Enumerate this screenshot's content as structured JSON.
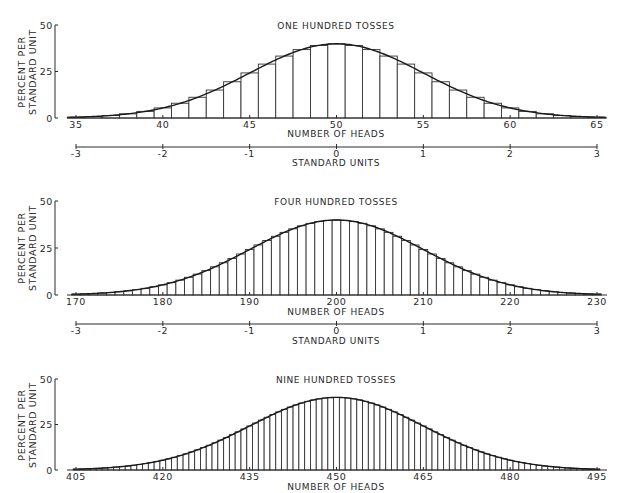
{
  "chart_data": [
    {
      "type": "bar",
      "title": "ONE HUNDRED TOSSES",
      "tosses": 100,
      "xlabel": "NUMBER OF HEADS",
      "ylabel": [
        "PERCENT PER",
        "STANDARD UNIT"
      ],
      "ylim": [
        0,
        50
      ],
      "yticks": [
        0,
        25,
        50
      ],
      "x_range": [
        35,
        65
      ],
      "xticks": [
        35,
        40,
        45,
        50,
        55,
        60,
        65
      ],
      "standard_units_axis": {
        "label": "STANDARD UNITS",
        "ticks": [
          -3,
          -2,
          -1,
          0,
          1,
          2,
          3
        ]
      },
      "overlay": "normal curve",
      "note": "histogram of binomial probability (p=0.5) for number of heads, scaled in percent per standard unit; peak about 39.8"
    },
    {
      "type": "bar",
      "title": "FOUR HUNDRED TOSSES",
      "tosses": 400,
      "xlabel": "NUMBER OF HEADS",
      "ylabel": [
        "PERCENT PER",
        "STANDARD UNIT"
      ],
      "ylim": [
        0,
        50
      ],
      "yticks": [
        0,
        25,
        50
      ],
      "x_range": [
        170,
        230
      ],
      "xticks": [
        170,
        180,
        190,
        200,
        210,
        220,
        230
      ],
      "standard_units_axis": {
        "label": "STANDARD UNITS",
        "ticks": [
          -3,
          -2,
          -1,
          0,
          1,
          2,
          3
        ]
      },
      "overlay": "normal curve"
    },
    {
      "type": "bar",
      "title": "NINE HUNDRED TOSSES",
      "tosses": 900,
      "xlabel": "NUMBER OF HEADS",
      "ylabel": [
        "PERCENT PER",
        "STANDARD UNIT"
      ],
      "ylim": [
        0,
        50
      ],
      "yticks": [
        0,
        25,
        50
      ],
      "x_range": [
        405,
        495
      ],
      "xticks": [
        405,
        420,
        435,
        450,
        465,
        480,
        495
      ],
      "overlay": "normal curve"
    }
  ],
  "panels": [
    {
      "title": "ONE HUNDRED TOSSES",
      "xlabel": "NUMBER OF HEADS",
      "ylabel1": "PERCENT PER",
      "ylabel2": "STANDARD UNIT",
      "su_label": "STANDARD UNITS"
    },
    {
      "title": "FOUR HUNDRED TOSSES",
      "xlabel": "NUMBER OF HEADS",
      "ylabel1": "PERCENT PER",
      "ylabel2": "STANDARD UNIT",
      "su_label": "STANDARD UNITS"
    },
    {
      "title": "NINE HUNDRED TOSSES",
      "xlabel": "NUMBER OF HEADS",
      "ylabel1": "PERCENT PER",
      "ylabel2": "STANDARD UNIT"
    }
  ]
}
